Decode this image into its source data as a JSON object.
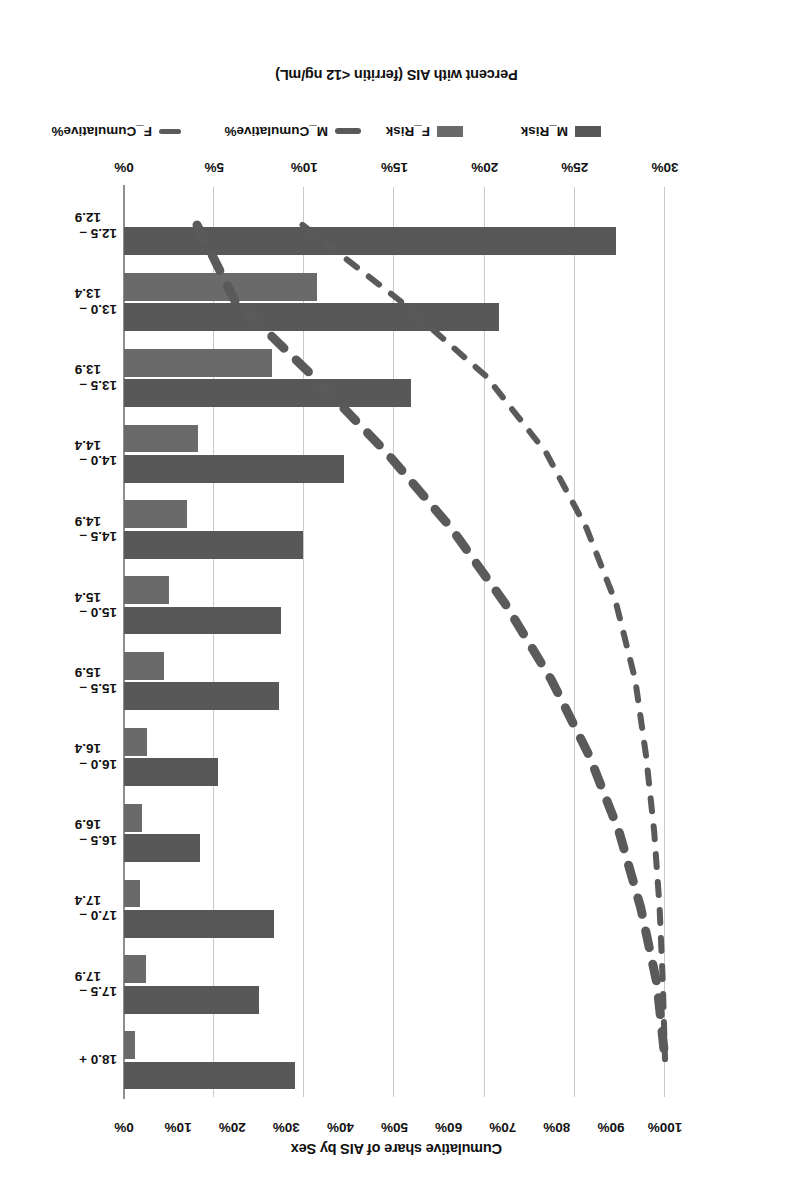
{
  "chart_data": {
    "type": "bar",
    "title": "",
    "orientation": "horizontal-bars-with-secondary-cumulative-lines",
    "rotation_note": "scan is rotated 180 degrees",
    "xlabel": "Percent with AIS (ferritin <12 ng/mL)",
    "secondary_axis_label": "Cumulative share of AIS by Sex",
    "ylabel": "",
    "categories": [
      "12.5 – 12.9",
      "13.0 – 13.4",
      "13.5 – 13.9",
      "14.0 – 14.4",
      "14.5 – 14.9",
      "15.0 – 15.4",
      "15.5 – 15.9",
      "16.0 – 16.4",
      "16.5 – 16.9",
      "17.0 – 17.4",
      "17.5 – 17.9",
      "18.0 +"
    ],
    "category_lines": [
      [
        "12.5 –",
        "12.9"
      ],
      [
        "13.0 –",
        "13.4"
      ],
      [
        "13.5 –",
        "13.9"
      ],
      [
        "14.0 –",
        "14.4"
      ],
      [
        "14.5 –",
        "14.9"
      ],
      [
        "15.0 –",
        "15.4"
      ],
      [
        "15.5 –",
        "15.9"
      ],
      [
        "16.0 –",
        "16.4"
      ],
      [
        "16.5 –",
        "16.9"
      ],
      [
        "17.0 –",
        "17.4"
      ],
      [
        "17.5 –",
        "17.9"
      ],
      [
        "18.0 +",
        ""
      ]
    ],
    "xlim": [
      0,
      30
    ],
    "xticks": [
      0,
      5,
      10,
      15,
      20,
      25,
      30
    ],
    "xticklabels": [
      "0%",
      "5%",
      "10%",
      "15%",
      "20%",
      "25%",
      "30%"
    ],
    "secondary_lim": [
      0,
      100
    ],
    "secondary_ticks": [
      0,
      10,
      20,
      30,
      40,
      50,
      60,
      70,
      80,
      90,
      100
    ],
    "secondary_ticklabels": [
      "0%",
      "10%",
      "20%",
      "30%",
      "40%",
      "50%",
      "60%",
      "70%",
      "80%",
      "90%",
      "100%"
    ],
    "grid": true,
    "legend_position": "bottom",
    "series": [
      {
        "name": "M_Risk",
        "kind": "bar",
        "axis": "primary",
        "color": "#585858",
        "values": [
          27.3,
          20.8,
          15.9,
          12.2,
          9.9,
          8.7,
          8.6,
          5.2,
          4.2,
          8.3,
          7.5,
          9.5
        ]
      },
      {
        "name": "F_Risk",
        "kind": "bar",
        "axis": "primary",
        "color": "#6a6a6a",
        "values": [
          0.0,
          10.7,
          8.2,
          4.1,
          3.5,
          2.5,
          2.2,
          1.3,
          1.0,
          0.9,
          1.2,
          0.6
        ]
      },
      {
        "name": "M_Cumulative%",
        "kind": "line-dashed-thick",
        "axis": "secondary",
        "color": "#5a5a5a",
        "values": [
          13.5,
          20.5,
          35.0,
          48.5,
          60.5,
          70.5,
          79.0,
          86.0,
          91.5,
          95.5,
          98.5,
          100.0
        ]
      },
      {
        "name": "F_Cumulative%",
        "kind": "line-dashed-thin",
        "axis": "secondary",
        "color": "#5a5a5a",
        "values": [
          33.0,
          51.0,
          67.0,
          78.0,
          85.5,
          91.0,
          94.5,
          96.5,
          98.0,
          99.0,
          99.6,
          100.0
        ]
      }
    ],
    "legend": [
      {
        "label": "M_Risk",
        "marker": "bar",
        "color": "#585858"
      },
      {
        "label": "F_Risk",
        "marker": "bar",
        "color": "#6a6a6a"
      },
      {
        "label": "M_Cumulative%",
        "marker": "dashed-line-thick",
        "color": "#5a5a5a"
      },
      {
        "label": "F_Cumulative%",
        "marker": "dashed-line-thin",
        "color": "#5a5a5a"
      }
    ]
  }
}
